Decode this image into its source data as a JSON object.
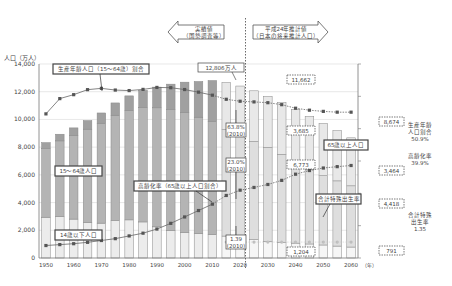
{
  "chart_data": {
    "type": "bar",
    "title": "",
    "ylabel": "人口（万人）",
    "xlabel_unit": "（年）",
    "ylim": [
      0,
      14000
    ],
    "yticks": [
      "0",
      "2,000",
      "4,000",
      "6,000",
      "8,000",
      "10,000",
      "12,000",
      "14,000"
    ],
    "yticks_values": [
      0,
      2000,
      4000,
      6000,
      8000,
      10000,
      12000,
      14000
    ],
    "xticks": [
      "1950",
      "1960",
      "1970",
      "1980",
      "1990",
      "2000",
      "2010",
      "2020",
      "2030",
      "2040",
      "2050",
      "2060"
    ],
    "years": [
      1950,
      1955,
      1960,
      1965,
      1970,
      1975,
      1980,
      1985,
      1990,
      1995,
      2000,
      2005,
      2010,
      2015,
      2020,
      2025,
      2030,
      2035,
      2040,
      2045,
      2050,
      2055,
      2060
    ],
    "series": [
      {
        "name": "14歳以下人口",
        "values": [
          2943,
          2980,
          2807,
          2553,
          2515,
          2722,
          2751,
          2603,
          2249,
          2001,
          1847,
          1752,
          1684,
          1583,
          1457,
          1324,
          1204,
          1129,
          1073,
          1012,
          939,
          861,
          791
        ]
      },
      {
        "name": "15〜64歳人口",
        "values": [
          4966,
          5473,
          6047,
          6744,
          7212,
          7581,
          7883,
          8251,
          8590,
          8716,
          8638,
          8409,
          8173,
          7682,
          7341,
          7085,
          6773,
          6343,
          5787,
          5353,
          5001,
          4706,
          4418
        ]
      },
      {
        "name": "65歳以上人口",
        "values": [
          416,
          479,
          535,
          618,
          739,
          887,
          1065,
          1247,
          1493,
          1828,
          2204,
          2576,
          2948,
          3395,
          3612,
          3657,
          3685,
          3741,
          3868,
          3856,
          3768,
          3626,
          3464
        ]
      }
    ],
    "line_series": [
      {
        "name": "生産年齢人口（15〜64歳）割合",
        "values_pct": [
          49.6,
          61.2,
          64.2,
          68.0,
          69.0,
          67.7,
          67.3,
          68.2,
          69.7,
          69.5,
          68.1,
          66.1,
          63.8,
          60.7,
          59.2,
          58.7,
          58.1,
          56.6,
          53.9,
          52.4,
          51.5,
          50.9,
          50.9
        ]
      },
      {
        "name": "高齢化率（65歳以上人口割合）",
        "values_pct": [
          4.9,
          5.3,
          5.7,
          6.3,
          7.1,
          7.9,
          9.1,
          10.3,
          12.1,
          14.6,
          17.4,
          20.2,
          23.0,
          26.8,
          29.1,
          30.3,
          31.6,
          33.4,
          36.1,
          37.7,
          38.8,
          39.4,
          39.9
        ]
      },
      {
        "name": "合計特殊出生率",
        "values": [
          null,
          null,
          null,
          null,
          null,
          null,
          null,
          null,
          null,
          null,
          null,
          null,
          1.39,
          1.35,
          1.35,
          1.35,
          1.35,
          1.35,
          1.35,
          1.35,
          1.35,
          1.35,
          1.35
        ]
      }
    ],
    "annotations": {
      "actual_arrow": [
        "実績値",
        "（国勢調査等）"
      ],
      "projected_arrow": [
        "平成24年推計値",
        "（日本の将来推計人口）"
      ],
      "total_2010": "12,806万人",
      "total_2030": "11,662",
      "total_2060": "8,674",
      "old_2030": "3,685",
      "old_2060": "3,464",
      "working_2030": "6,773",
      "working_2060": "4,418",
      "young_2030": "1,204",
      "young_2060": "791",
      "working_pct_2010": [
        "63.8%",
        "(2010)"
      ],
      "aging_pct_2010": [
        "23.0%",
        "(2010)"
      ],
      "tfr_2010": [
        "1.39",
        "(2010)"
      ],
      "label_working_ratio": "生産年齢人口（15〜64歳）割合",
      "label_working": "15〜64歳人口",
      "label_young": "14歳以下人口",
      "label_aging": "高齢化率（65歳以上人口割合）",
      "label_old": "65歳以上人口",
      "label_tfr": "合計特殊出生率",
      "right_working": [
        "生産年齢",
        "人口割合",
        "50.9%"
      ],
      "right_aging": [
        "高齢化率",
        "39.9%"
      ],
      "right_tfr": [
        "合計特殊",
        "出生率",
        "1.35"
      ]
    },
    "colors": {
      "young_actual": "#ececec",
      "working_actual": "#b4b4b4",
      "old_actual": "#a0a0a0",
      "young_proj": "#f6f6f6",
      "working_proj": "#dedede",
      "old_proj": "#e8e8e8",
      "line": "#666666",
      "marker": "#555555",
      "tfr_marker": "#bdbdbd"
    },
    "legend": "none (inline labels)",
    "grid": true
  }
}
